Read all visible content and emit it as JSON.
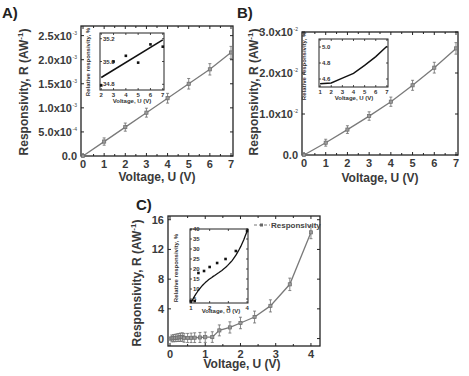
{
  "chart_data": [
    {
      "panel": "A)",
      "type": "line",
      "xlabel": "Voltage, U (V)",
      "ylabel": "Responsivity, R (AW -1)",
      "x": [
        0,
        1,
        2,
        3,
        4,
        5,
        6,
        7
      ],
      "values": [
        0.0,
        0.0003,
        0.0006,
        0.0009,
        0.0012,
        0.0015,
        0.0018,
        0.00215
      ],
      "xlim": [
        0,
        7
      ],
      "ylim": [
        0,
        0.0027
      ],
      "x_ticks": [
        "0",
        "1",
        "2",
        "3",
        "4",
        "5",
        "6",
        "7"
      ],
      "y_ticks": [
        "0.0",
        "5.0x10",
        "1.0x10",
        "1.5x10",
        "2.0x10",
        "2.5x10"
      ],
      "y_tick_exponents": [
        "",
        "-4",
        "-3",
        "-3",
        "-3",
        "-3"
      ],
      "error_bars": true,
      "inset": {
        "type": "scatter+fit",
        "xlabel": "Voltage, U (V)",
        "ylabel": "Relative responsivity, %",
        "x": [
          2,
          3,
          4,
          5,
          6,
          7
        ],
        "values": [
          34.79,
          35.0,
          35.05,
          34.99,
          35.15,
          35.13
        ],
        "fit_line": [
          [
            2,
            34.86
          ],
          [
            7,
            35.19
          ]
        ],
        "x_ticks": [
          "2",
          "3",
          "4",
          "5",
          "6",
          "7"
        ],
        "y_ticks": [
          "34.8",
          "35.0",
          "35.2"
        ],
        "ylim": [
          34.75,
          35.25
        ]
      }
    },
    {
      "panel": "B)",
      "type": "line",
      "xlabel": "Voltage, U (V)",
      "ylabel": "Responsivity, R (AW -1)",
      "x": [
        0,
        1,
        2,
        3,
        4,
        5,
        6,
        7
      ],
      "values": [
        0.0,
        0.003,
        0.0062,
        0.0095,
        0.013,
        0.017,
        0.0213,
        0.026
      ],
      "xlim": [
        0,
        7
      ],
      "ylim": [
        0,
        0.03
      ],
      "x_ticks": [
        "0",
        "1",
        "2",
        "3",
        "4",
        "5",
        "6",
        "7"
      ],
      "y_ticks": [
        "0.0",
        "1.0x10",
        "2.0x10",
        "3.0x10"
      ],
      "y_tick_exponents": [
        "",
        "-2",
        "-2",
        "-2"
      ],
      "error_bars": true,
      "inset": {
        "type": "line",
        "xlabel": "Voltage, U (V)",
        "ylabel": "Relative responsivity, %",
        "x": [
          1,
          2,
          3,
          4,
          5,
          6,
          7
        ],
        "values": [
          4.54,
          4.55,
          4.61,
          4.67,
          4.77,
          4.88,
          5.01
        ],
        "x_ticks": [
          "1",
          "2",
          "3",
          "4",
          "5",
          "6",
          "7"
        ],
        "y_ticks": [
          "4.6",
          "4.8",
          "5.0"
        ],
        "ylim": [
          4.5,
          5.1
        ]
      }
    },
    {
      "panel": "C)",
      "type": "line",
      "xlabel": "Voltage, U (V)",
      "ylabel": "Responsivity, R (AW -1)",
      "legend": [
        "Responsivity"
      ],
      "legend_position": "upper right",
      "x": [
        0.0,
        0.05,
        0.1,
        0.15,
        0.2,
        0.25,
        0.3,
        0.35,
        0.4,
        0.5,
        0.6,
        0.7,
        0.85,
        1.0,
        1.2,
        1.4,
        1.7,
        2.0,
        2.4,
        2.85,
        3.4,
        4.0
      ],
      "values": [
        0.0,
        0.02,
        0.05,
        0.08,
        0.12,
        0.15,
        0.18,
        0.2,
        0.1,
        0.08,
        0.1,
        0.12,
        0.15,
        0.18,
        0.2,
        1.1,
        1.5,
        2.1,
        2.9,
        4.4,
        7.3,
        14.3
      ],
      "xlim": [
        0,
        4.2
      ],
      "ylim": [
        -1,
        16.5
      ],
      "x_ticks": [
        "0",
        "1",
        "2",
        "3",
        "4"
      ],
      "y_ticks": [
        "0",
        "4",
        "8",
        "12",
        "16"
      ],
      "error_bars": true,
      "inset": {
        "type": "scatter+fit",
        "xlabel": "Voltage, U (V)",
        "ylabel": "Relative responsivity, %",
        "x": [
          1.0,
          1.2,
          1.4,
          1.7,
          2.0,
          2.4,
          2.85,
          3.4,
          4.0
        ],
        "values": [
          4,
          4,
          18,
          19,
          21,
          23,
          25,
          29,
          39
        ],
        "x_ticks": [
          "1",
          "2",
          "3",
          "4"
        ],
        "y_ticks": [
          "5",
          "10",
          "15",
          "20",
          "25",
          "30",
          "35",
          "40"
        ],
        "ylim": [
          3,
          40
        ]
      }
    }
  ],
  "panels": {
    "a": {
      "label": "A)",
      "xlabel": "Voltage, U (V)",
      "ylabel": "Responsivity, R (AW",
      "ylabel_exp": "-1",
      "ylabel_close": ")",
      "inset_xlabel": "Voltage, U (V)",
      "inset_ylabel": "Relative responsivity, %"
    },
    "b": {
      "label": "B)",
      "xlabel": "Voltage, U (V)",
      "ylabel": "Responsivity, R (AW",
      "ylabel_exp": "-1",
      "ylabel_close": ")",
      "inset_xlabel": "Voltage, U (V)",
      "inset_ylabel": "Relative responsivity, %"
    },
    "c": {
      "label": "C)",
      "xlabel": "Voltage, U (V)",
      "ylabel": "Responsivity, R (AW",
      "ylabel_exp": "-1",
      "ylabel_close": ")",
      "inset_xlabel": "Voltage, U (V)",
      "inset_ylabel": "Relative responsivity, %",
      "legend": "Responsivity"
    }
  },
  "colors": {
    "series": "#7a7a7a",
    "marker": "#6a6a6a",
    "axis": "#222222",
    "inset_line": "#111111"
  }
}
